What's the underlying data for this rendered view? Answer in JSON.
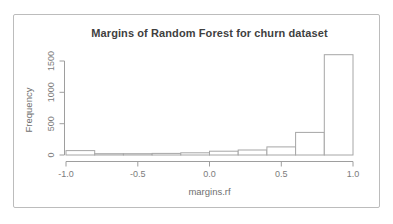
{
  "frame": {
    "border_color": "#bcbcbc",
    "fill": "#ffffff"
  },
  "chart_data": {
    "type": "bar",
    "variant": "histogram",
    "title": "Margins of Random Forest for churn dataset",
    "xlabel": "margins.rf",
    "ylabel": "Frequency",
    "bin_edges": [
      -1.0,
      -0.8,
      -0.6,
      -0.4,
      -0.2,
      0.0,
      0.2,
      0.4,
      0.6,
      0.8,
      1.0
    ],
    "counts": [
      70,
      20,
      20,
      25,
      35,
      60,
      80,
      130,
      360,
      1600
    ],
    "x_ticks": [
      -1.0,
      -0.5,
      0.0,
      0.5,
      1.0
    ],
    "x_tick_labels": [
      "-1.0",
      "-0.5",
      "0.0",
      "0.5",
      "1.0"
    ],
    "y_ticks": [
      0,
      500,
      1000,
      1500
    ],
    "y_tick_labels": [
      "0",
      "500",
      "1000",
      "1500"
    ],
    "xlim": [
      -1.0,
      1.0
    ],
    "ylim": [
      0,
      1500
    ],
    "grid": false,
    "legend": null,
    "bar_fill": "#ffffff",
    "bar_stroke": "#a6a6a6",
    "axis_color": "#9e9e9e",
    "tick_label_color": "#7c7c7c",
    "title_color": "#3f3f3f",
    "axis_title_color": "#6f6f6f"
  }
}
